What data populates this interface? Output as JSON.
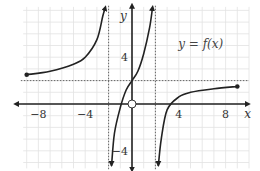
{
  "chart_data": {
    "type": "line",
    "title": "y = f(x)",
    "xlabel": "x",
    "ylabel": "y",
    "xlim": [
      -9.5,
      10
    ],
    "ylim": [
      -5.5,
      8.5
    ],
    "grid": true,
    "x_ticks": [
      -8,
      -4,
      4,
      8
    ],
    "y_ticks": [
      4,
      -4
    ],
    "x_tick_labels": [
      "−8",
      "−4",
      "4",
      "8"
    ],
    "y_tick_labels": [
      "4",
      "−4"
    ],
    "asymptotes": {
      "vertical": [
        -2,
        2
      ],
      "horizontal": [
        2
      ]
    },
    "series": [
      {
        "name": "left branch",
        "domain": [
          -9,
          -2
        ],
        "points": [
          [
            -9,
            2.5
          ],
          [
            -7,
            2.8
          ],
          [
            -5,
            3.4
          ],
          [
            -4,
            4.0
          ],
          [
            -3,
            5.5
          ],
          [
            -2.5,
            7.5
          ],
          [
            -2.3,
            8.2
          ]
        ],
        "start_marker": "filled",
        "end": "arrow-up"
      },
      {
        "name": "middle branch",
        "domain": [
          -2,
          2
        ],
        "points": [
          [
            -1.75,
            -5.3
          ],
          [
            -1.5,
            -2.5
          ],
          [
            -1,
            -0.3
          ],
          [
            -0.5,
            1.2
          ],
          [
            0,
            2
          ],
          [
            0.5,
            2.8
          ],
          [
            1,
            4.3
          ],
          [
            1.5,
            6.5
          ],
          [
            1.75,
            8.2
          ]
        ],
        "start": "arrow-down",
        "end": "arrow-up"
      },
      {
        "name": "right branch",
        "domain": [
          2,
          9
        ],
        "points": [
          [
            2.25,
            -5.3
          ],
          [
            2.5,
            -3
          ],
          [
            3,
            -0.5
          ],
          [
            4,
            0.6
          ],
          [
            5,
            1.0
          ],
          [
            7,
            1.3
          ],
          [
            9,
            1.5
          ]
        ],
        "start": "arrow-down",
        "end_marker": "filled"
      }
    ],
    "open_points": [
      [
        0,
        0
      ]
    ],
    "annotations": [
      {
        "text": "y = f(x)",
        "x": 6,
        "y": 4.8
      }
    ]
  }
}
